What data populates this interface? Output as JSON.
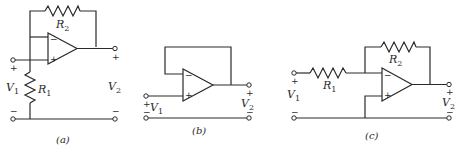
{
  "figure": {
    "panels": [
      {
        "id": "a",
        "caption": "(a)",
        "type": "non-inverting amplifier",
        "labels": {
          "R_feedback": "R",
          "R_feedback_sub": "2",
          "R_ground": "R",
          "R_ground_sub": "1",
          "input": "V",
          "input_sub": "1",
          "output": "V",
          "output_sub": "2"
        },
        "opamp_inputs": {
          "top": "−",
          "bottom": "+"
        },
        "input_plus": "+",
        "input_minus": "−",
        "output_plus": "+",
        "output_minus": "−"
      },
      {
        "id": "b",
        "caption": "(b)",
        "type": "voltage follower",
        "labels": {
          "input": "V",
          "input_sub": "1",
          "output": "V",
          "output_sub": "2"
        },
        "opamp_inputs": {
          "top": "−",
          "bottom": "+"
        },
        "input_plus": "+",
        "input_minus": "−",
        "output_plus": "+",
        "output_minus": "−"
      },
      {
        "id": "c",
        "caption": "(c)",
        "type": "inverting amplifier",
        "labels": {
          "R_input": "R",
          "R_input_sub": "1",
          "R_feedback": "R",
          "R_feedback_sub": "2",
          "input": "V",
          "input_sub": "1",
          "output": "V",
          "output_sub": "2"
        },
        "opamp_inputs": {
          "top": "−",
          "bottom": "+"
        },
        "input_plus": "+",
        "input_minus": "−",
        "output_plus": "+",
        "output_minus": "−"
      }
    ]
  }
}
